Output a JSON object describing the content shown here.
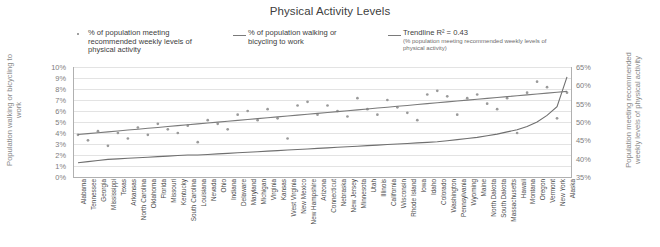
{
  "chart_data": {
    "type": "scatter",
    "title": "Physical Activity Levels",
    "xlabel": "",
    "ylabel": "Population walking or bicycling to work",
    "y2label": "Population meeting recommended weekly levels of physical activity",
    "grid": true,
    "legend_position": "top",
    "ylim": [
      0,
      10
    ],
    "y2lim": [
      35,
      65
    ],
    "yticks": [
      "0%",
      "1%",
      "2%",
      "3%",
      "4%",
      "5%",
      "6%",
      "7%",
      "8%",
      "9%",
      "10%"
    ],
    "y2ticks": [
      "35%",
      "40%",
      "45%",
      "50%",
      "55%",
      "60%",
      "65%"
    ],
    "categories": [
      "Alabama",
      "Tennessee",
      "Georgia",
      "Mississippi",
      "Texas",
      "Arkansas",
      "North Carolina",
      "Oklahoma",
      "Florida",
      "Missouri",
      "Kentucky",
      "South Carolina",
      "Louisiana",
      "Nevada",
      "Ohio",
      "Indiana",
      "Delaware",
      "Maryland",
      "Michigan",
      "Virginia",
      "Kansas",
      "West Virginia",
      "New Mexico",
      "New Hampshire",
      "Arizona",
      "Connecticut",
      "Nebraska",
      "New Jersey",
      "Minnesota",
      "Utah",
      "Illinois",
      "California",
      "Wisconsin",
      "Rhode Island",
      "Iowa",
      "Idaho",
      "Colorado",
      "Washington",
      "Pennsylvania",
      "Wyoming",
      "Maine",
      "North Dakota",
      "South Dakota",
      "Massachusetts",
      "Hawaii",
      "Montana",
      "Oregon",
      "Vermont",
      "New York",
      "Alaska"
    ],
    "series": [
      {
        "name": "% of population meeting recommended weekly levels of physical activity",
        "type": "scatter",
        "axis": "right",
        "marker": "dot",
        "color": "#9a9a9a",
        "values": [
          46.5,
          45.0,
          47.5,
          43.5,
          47.0,
          45.5,
          48.5,
          46.5,
          49.5,
          48.0,
          47.0,
          49.0,
          44.5,
          50.5,
          49.5,
          48.0,
          52.0,
          53.0,
          50.5,
          53.5,
          51.0,
          45.5,
          54.5,
          55.5,
          52.0,
          54.5,
          53.0,
          51.5,
          56.5,
          53.5,
          52.0,
          56.0,
          54.0,
          52.5,
          50.5,
          57.5,
          58.5,
          57.0,
          52.0,
          56.5,
          57.5,
          55.0,
          53.5,
          56.5,
          47.0,
          58.0,
          61.0,
          59.5,
          51.0,
          58.0
        ]
      },
      {
        "name": "% of population walking or bicycling to work",
        "type": "line",
        "axis": "left",
        "color": "#6f6f6f",
        "values": [
          1.3,
          1.4,
          1.5,
          1.6,
          1.65,
          1.7,
          1.75,
          1.8,
          1.85,
          1.9,
          1.95,
          2.0,
          2.0,
          2.05,
          2.1,
          2.15,
          2.2,
          2.25,
          2.3,
          2.35,
          2.4,
          2.45,
          2.5,
          2.55,
          2.6,
          2.65,
          2.7,
          2.75,
          2.8,
          2.85,
          2.9,
          2.95,
          3.0,
          3.05,
          3.1,
          3.15,
          3.2,
          3.3,
          3.4,
          3.5,
          3.6,
          3.75,
          3.9,
          4.1,
          4.3,
          4.6,
          5.0,
          5.6,
          6.4,
          9.1
        ]
      },
      {
        "name": "Trendline R² = 0.43",
        "type": "line",
        "axis": "right",
        "color": "#7a7a7a",
        "values": [
          46.6,
          46.84,
          47.08,
          47.32,
          47.56,
          47.8,
          48.04,
          48.28,
          48.52,
          48.76,
          49.0,
          49.24,
          49.48,
          49.72,
          49.96,
          50.2,
          50.44,
          50.68,
          50.92,
          51.16,
          51.4,
          51.64,
          51.88,
          52.12,
          52.36,
          52.6,
          52.84,
          53.08,
          53.32,
          53.56,
          53.8,
          54.04,
          54.28,
          54.52,
          54.76,
          55.0,
          55.24,
          55.48,
          55.72,
          55.96,
          56.2,
          56.44,
          56.68,
          56.92,
          57.16,
          57.4,
          57.64,
          57.88,
          58.12,
          58.36
        ]
      }
    ]
  },
  "legend": {
    "items": [
      {
        "marker": "dot",
        "label": "% of population meeting recommended weekly levels of physical activity",
        "sublabel": ""
      },
      {
        "marker": "line",
        "label": "% of population walking or bicycling to work",
        "sublabel": ""
      },
      {
        "marker": "line",
        "label": "Trendline R² = 0.43",
        "sublabel": "(% population meeting recommended weekly levels of physical activity)"
      }
    ]
  },
  "colors": {
    "scatter": "#9a9a9a",
    "walk_line": "#6f6f6f",
    "trendline": "#7a7a7a",
    "grid": "#e3e3e3",
    "axis": "#b0b0b0",
    "text": "#404040",
    "muted_text": "#8a8a8a"
  }
}
